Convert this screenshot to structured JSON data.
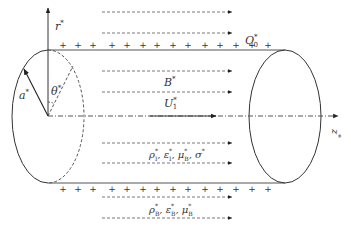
{
  "diagram": {
    "labels": {
      "r_axis": "r",
      "z_axis": "z",
      "radius": "a",
      "angle": "θ",
      "surface_charge": "Q",
      "surface_charge_sub": "0",
      "magnetic_field": "B",
      "velocity": "U",
      "velocity_sub": "1",
      "inner_props": [
        {
          "sym": "ρ",
          "sub": "I"
        },
        {
          "sym": "ε",
          "sub": "I"
        },
        {
          "sym": "μ",
          "sub": "B"
        },
        {
          "sym": "σ",
          "sub": ""
        }
      ],
      "outer_props": [
        {
          "sym": "ρ",
          "sub": "B"
        },
        {
          "sym": "ε",
          "sub": "B"
        },
        {
          "sym": "μ",
          "sub": "B"
        }
      ],
      "star": "*",
      "plus": "+"
    },
    "colors": {
      "line": "#333333",
      "dashed": "#555555"
    }
  }
}
